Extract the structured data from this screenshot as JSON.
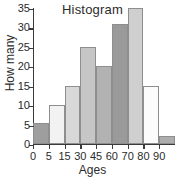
{
  "chart_data": {
    "type": "bar",
    "title": "Histogram",
    "xlabel": "Ages",
    "ylabel": "How many",
    "categories": [
      "0-5",
      "5-15",
      "15-30",
      "30-45",
      "45-60",
      "60-70",
      "70-80",
      "80-90",
      "90+"
    ],
    "values": [
      5.5,
      10,
      15,
      25,
      20,
      31,
      35,
      15,
      2
    ],
    "bar_colors": [
      "#9e9e9e",
      "#f2f2f2",
      "#d8d8d8",
      "#c6c6c6",
      "#b2b2b2",
      "#9a9a9a",
      "#cfcfcf",
      "#fbfbfb",
      "#adadad"
    ],
    "x_tick_labels": [
      "0",
      "5",
      "15",
      "30",
      "45",
      "60",
      "70",
      "80",
      "90"
    ],
    "y_tick_labels": [
      "0",
      "5",
      "10",
      "15",
      "20",
      "25",
      "30",
      "35"
    ],
    "y_tick_values": [
      0,
      5,
      10,
      15,
      20,
      25,
      30,
      35
    ],
    "ylim": [
      0,
      35
    ],
    "grid": false,
    "legend": false,
    "axis_color": "#3a3a3a",
    "text_color": "#2b2b2b",
    "background": "#ffffff"
  }
}
